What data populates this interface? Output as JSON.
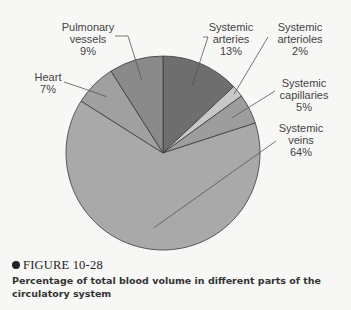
{
  "chart_data": {
    "type": "pie",
    "title": "Percentage of total blood volume in different parts of the circulatory system",
    "categories": [
      "Systemic arteries",
      "Systemic arterioles",
      "Systemic capillaries",
      "Systemic veins",
      "Heart",
      "Pulmonary vessels"
    ],
    "values": [
      13,
      2,
      5,
      64,
      7,
      9
    ],
    "unit": "%",
    "colors": [
      "#6e6e6e",
      "#c8c8c8",
      "#9d9d9d",
      "#a9a9a9",
      "#a0a0a0",
      "#8a8a8a"
    ],
    "start_angle_deg": 0,
    "direction": "clockwise",
    "legend": "none (callout labels)"
  },
  "labels": [
    {
      "line1": "Systemic",
      "line2": "arteries",
      "pct": "13%"
    },
    {
      "line1": "Systemic",
      "line2": "arterioles",
      "pct": "2%"
    },
    {
      "line1": "Systemic",
      "line2": "capillaries",
      "pct": "5%"
    },
    {
      "line1": "Systemic",
      "line2": "veins",
      "pct": "64%"
    },
    {
      "line1": "Heart",
      "line2": "",
      "pct": "7%"
    },
    {
      "line1": "Pulmonary",
      "line2": "vessels",
      "pct": "9%"
    }
  ],
  "figure": {
    "number": "FIGURE 10-28",
    "caption": "Percentage of total blood volume in different parts of the circulatory system"
  }
}
